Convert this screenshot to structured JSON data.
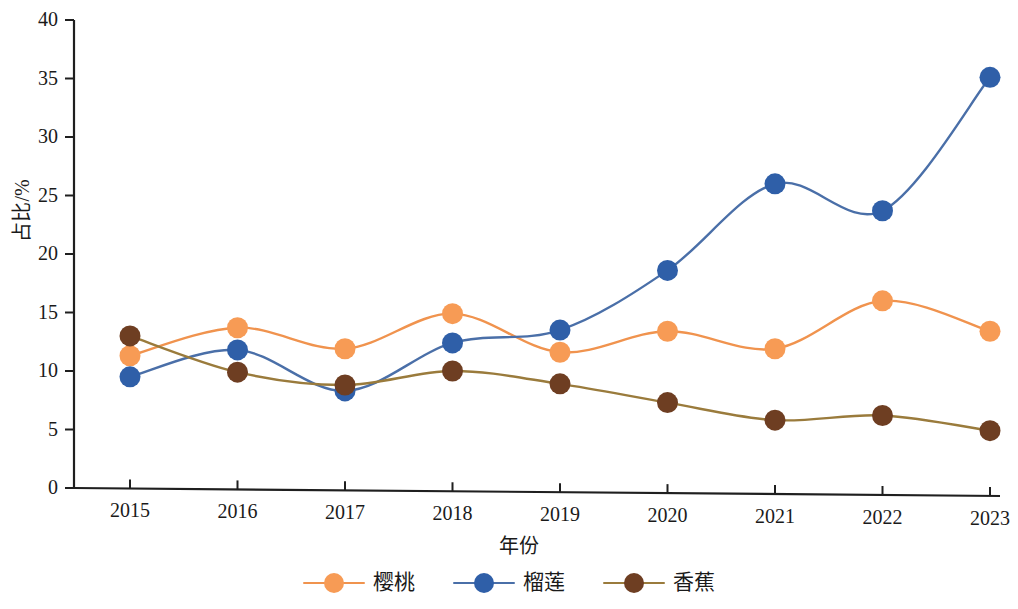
{
  "chart_data": {
    "type": "line",
    "title": "",
    "xlabel": "年份",
    "ylabel": "占比/%",
    "categories": [
      "2015",
      "2016",
      "2017",
      "2018",
      "2019",
      "2020",
      "2021",
      "2022",
      "2023"
    ],
    "x": [
      2015,
      2016,
      2017,
      2018,
      2019,
      2020,
      2021,
      2022,
      2023
    ],
    "ylim": [
      0,
      40
    ],
    "yticks": [
      0,
      5,
      10,
      15,
      20,
      25,
      30,
      35,
      40
    ],
    "grid": false,
    "legend_position": "bottom",
    "smooth": true,
    "series": [
      {
        "name": "樱桃",
        "color": "#F0934E",
        "marker_color": "#F79B55",
        "values": [
          11.3,
          13.7,
          11.9,
          14.9,
          11.6,
          13.4,
          11.9,
          16.0,
          13.4
        ]
      },
      {
        "name": "榴莲",
        "color": "#4A6FA8",
        "marker_color": "#2F5FA8",
        "values": [
          9.5,
          11.8,
          8.3,
          12.4,
          13.5,
          18.6,
          26.0,
          23.7,
          35.1
        ]
      },
      {
        "name": "香蕉",
        "color": "#9A7B3C",
        "marker_color": "#6E3E22",
        "values": [
          13.0,
          9.9,
          8.8,
          10.0,
          8.9,
          7.3,
          5.8,
          6.2,
          4.9
        ]
      }
    ]
  },
  "axes": {
    "y_title": "占比/%",
    "x_title": "年份",
    "y_tick_labels": [
      "0",
      "5",
      "10",
      "15",
      "20",
      "25",
      "30",
      "35",
      "40"
    ],
    "x_tick_labels": [
      "2015",
      "2016",
      "2017",
      "2018",
      "2019",
      "2020",
      "2021",
      "2022",
      "2023"
    ]
  },
  "legend": {
    "items": [
      {
        "label": "樱桃",
        "color": "#F0934E",
        "marker_color": "#F79B55"
      },
      {
        "label": "榴莲",
        "color": "#4A6FA8",
        "marker_color": "#2F5FA8"
      },
      {
        "label": "香蕉",
        "color": "#9A7B3C",
        "marker_color": "#6E3E22"
      }
    ]
  },
  "colors": {
    "axis": "#1f1f1f",
    "background": "#ffffff",
    "cherry": "#F0934E",
    "durian": "#4A6FA8",
    "banana": "#9A7B3C"
  }
}
